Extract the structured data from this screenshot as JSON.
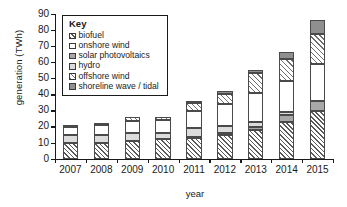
{
  "chart_data": {
    "type": "bar",
    "stacked": true,
    "title": "",
    "xlabel": "year",
    "ylabel": "generation (TWh)",
    "categories": [
      "2007",
      "2008",
      "2009",
      "2010",
      "2011",
      "2012",
      "2013",
      "2014",
      "2015"
    ],
    "ylim": [
      0,
      90
    ],
    "yticks": [
      0,
      10,
      20,
      30,
      40,
      50,
      60,
      70,
      80,
      90
    ],
    "grid": false,
    "legend": {
      "title": "Key",
      "position": "upper-left-inside",
      "entries": [
        "biofuel",
        "onshore wind",
        "solar photovoltaics",
        "hydro",
        "offshore wind",
        "shoreline wave / tidal"
      ]
    },
    "series": [
      {
        "name": "biofuel",
        "fill": "dark-diagonal-hatch",
        "values": [
          9.5,
          9.8,
          10.7,
          12.0,
          13.0,
          14.5,
          17.8,
          23.0,
          29.5
        ]
      },
      {
        "name": "solar photovoltaics",
        "fill": "medium-gray",
        "values": [
          0.0,
          0.0,
          0.1,
          0.2,
          0.4,
          1.2,
          2.0,
          4.0,
          6.5
        ]
      },
      {
        "name": "hydro",
        "fill": "light-gray",
        "values": [
          5.0,
          5.2,
          5.3,
          3.5,
          5.6,
          4.5,
          3.2,
          2.0,
          0.0
        ]
      },
      {
        "name": "onshore wind",
        "fill": "white",
        "values": [
          5.0,
          5.8,
          7.3,
          8.5,
          10.5,
          14.0,
          18.0,
          19.5,
          23.0
        ]
      },
      {
        "name": "offshore wind",
        "fill": "light-diagonal-hatch",
        "values": [
          1.0,
          1.5,
          2.3,
          2.0,
          5.0,
          6.0,
          12.0,
          13.5,
          18.5
        ]
      },
      {
        "name": "shoreline wave / tidal",
        "fill": "dark-gray",
        "values": [
          0.0,
          0.0,
          0.0,
          0.0,
          1.0,
          2.0,
          2.0,
          4.5,
          8.5
        ]
      }
    ],
    "totals": [
      20.5,
      22.3,
      25.7,
      26.2,
      35.5,
      42.2,
      55.0,
      66.5,
      86.0
    ]
  }
}
